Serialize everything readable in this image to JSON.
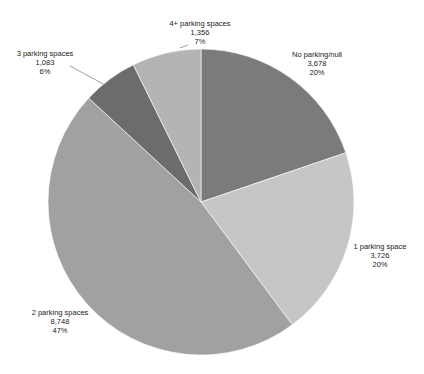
{
  "chart_data": {
    "type": "pie",
    "title": "",
    "start_angle_deg": 0,
    "direction": "clockwise",
    "slices": [
      {
        "label": "No parking/null",
        "value": 3678,
        "value_text": "3,678",
        "percent": "20%",
        "color": "#7b7b7b"
      },
      {
        "label": "1 parking space",
        "value": 3726,
        "value_text": "3,726",
        "percent": "20%",
        "color": "#c6c6c6"
      },
      {
        "label": "2 parking spaces",
        "value": 8748,
        "value_text": "8,748",
        "percent": "47%",
        "color": "#a1a1a1"
      },
      {
        "label": "3 parking spaces",
        "value": 1083,
        "value_text": "1,083",
        "percent": "6%",
        "color": "#6c6c6c"
      },
      {
        "label": "4+ parking spaces",
        "value": 1356,
        "value_text": "1,356",
        "percent": "7%",
        "color": "#b4b4b4"
      }
    ],
    "legend": "none (data labels on slices)"
  }
}
